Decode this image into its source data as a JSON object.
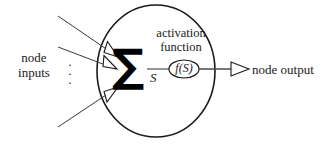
{
  "diagram": {
    "background_color": "#ffffff",
    "stroke_color": "#1a1a1a",
    "labels": {
      "node_inputs_line1": "node",
      "node_inputs_line2": "inputs",
      "node_output": "node output",
      "activation_line1": "activation",
      "activation_line2": "function",
      "sigma": "∑",
      "sum_variable": "S",
      "transfer_function": "f(S)",
      "ellipsis_dot": "·"
    },
    "geometry": {
      "circle_center_x": 156,
      "circle_center_y": 71,
      "circle_radius_x": 59,
      "circle_radius_y": 66,
      "ellipse_center_x": 184,
      "ellipse_center_y": 69,
      "ellipse_radius_x": 15,
      "ellipse_radius_y": 9
    },
    "input_connections": [
      {
        "name": "input-line-top",
        "x1": 58,
        "y1": 16,
        "x2": 116,
        "y2": 56
      },
      {
        "name": "input-line-middle",
        "x1": 58,
        "y1": 48,
        "x2": 114,
        "y2": 68
      },
      {
        "name": "input-line-bottom",
        "x1": 58,
        "y1": 126,
        "x2": 116,
        "y2": 88
      }
    ],
    "output_connection": {
      "name": "output-line",
      "x1": 199,
      "y1": 69,
      "x2": 232,
      "y2": 69
    }
  }
}
